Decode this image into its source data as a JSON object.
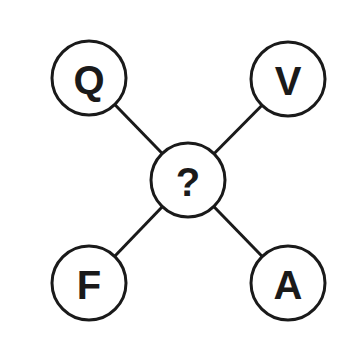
{
  "diagram": {
    "center": {
      "label": "?",
      "cx": 188,
      "cy": 180
    },
    "nodes": [
      {
        "id": "top-left",
        "label": "Q",
        "cx": 89,
        "cy": 78
      },
      {
        "id": "top-right",
        "label": "V",
        "cx": 288,
        "cy": 79
      },
      {
        "id": "bottom-left",
        "label": "F",
        "cx": 89,
        "cy": 283
      },
      {
        "id": "bottom-right",
        "label": "A",
        "cx": 288,
        "cy": 283
      }
    ],
    "radius": 37,
    "colors": {
      "stroke": "#1a1a1a",
      "fill": "#ffffff",
      "background": "#ffffff"
    }
  }
}
